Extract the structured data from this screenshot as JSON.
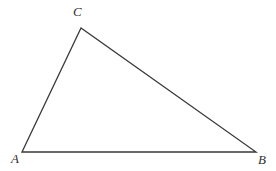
{
  "figure": {
    "kind": "geometry-diagram",
    "shape": "triangle",
    "width": 276,
    "height": 171,
    "background_color": "#ffffff",
    "stroke_color": "#3a3a3a",
    "stroke_width": 1.3,
    "label_color": "#2f2f2f"
  },
  "vertices": [
    {
      "id": "A",
      "label": "A",
      "x": 22,
      "y": 152,
      "label_x": 11,
      "label_y": 152
    },
    {
      "id": "B",
      "label": "B",
      "x": 256,
      "y": 152,
      "label_x": 258,
      "label_y": 153
    },
    {
      "id": "C",
      "label": "C",
      "x": 81,
      "y": 28,
      "label_x": 73,
      "label_y": 5
    }
  ],
  "edges": [
    {
      "id": "AC",
      "from": "A",
      "to": "C"
    },
    {
      "id": "CB",
      "from": "C",
      "to": "B"
    },
    {
      "id": "AB",
      "from": "A",
      "to": "B"
    }
  ],
  "polygon_points": "22,152 81,28 256,152"
}
